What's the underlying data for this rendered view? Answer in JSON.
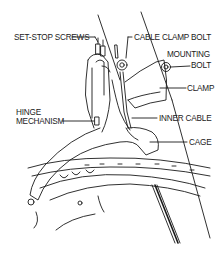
{
  "diagram": {
    "labels": [
      {
        "id": "set-stop-screws",
        "text": "SET-STOP SCREWS",
        "x": 14,
        "y": 34
      },
      {
        "id": "cable-clamp-bolt",
        "text": "CABLE CLAMP BOLT",
        "x": 134,
        "y": 34
      },
      {
        "id": "mounting",
        "text": "MOUNTING",
        "x": 167,
        "y": 51
      },
      {
        "id": "bolt",
        "text": "BOLT",
        "x": 191,
        "y": 61
      },
      {
        "id": "clamp",
        "text": "CLAMP",
        "x": 187,
        "y": 85
      },
      {
        "id": "hinge",
        "text": "HINGE",
        "x": 16,
        "y": 108
      },
      {
        "id": "mechanism",
        "text": "MECHANISM",
        "x": 16,
        "y": 117
      },
      {
        "id": "inner-cable",
        "text": "INNER CABLE",
        "x": 159,
        "y": 117
      },
      {
        "id": "cage",
        "text": "CAGE",
        "x": 189,
        "y": 139
      }
    ],
    "line_color": "#1a1a1a"
  }
}
